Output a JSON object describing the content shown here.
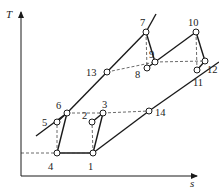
{
  "diagram": {
    "type": "T-s diagram",
    "axes": {
      "x_label": "s",
      "y_label": "T"
    },
    "states": [
      {
        "id": "1",
        "label": "1"
      },
      {
        "id": "2",
        "label": "2"
      },
      {
        "id": "3",
        "label": "3"
      },
      {
        "id": "4",
        "label": "4"
      },
      {
        "id": "5",
        "label": "5"
      },
      {
        "id": "6",
        "label": "6"
      },
      {
        "id": "7",
        "label": "7"
      },
      {
        "id": "8",
        "label": "8"
      },
      {
        "id": "9",
        "label": "9"
      },
      {
        "id": "10",
        "label": "10"
      },
      {
        "id": "11",
        "label": "11"
      },
      {
        "id": "12",
        "label": "12"
      },
      {
        "id": "13",
        "label": "13"
      },
      {
        "id": "14",
        "label": "14"
      }
    ],
    "processes_solid": [
      [
        "4",
        "6"
      ],
      [
        "6",
        "5"
      ],
      [
        "4",
        "1"
      ],
      [
        "1",
        "3"
      ],
      [
        "3",
        "2"
      ],
      [
        "1",
        "14"
      ],
      [
        "6",
        "13"
      ],
      [
        "13",
        "7"
      ],
      [
        "7",
        "9"
      ],
      [
        "9",
        "10"
      ],
      [
        "10",
        "12"
      ],
      [
        "12",
        "11"
      ],
      [
        "9",
        "8"
      ],
      [
        "14",
        "11"
      ]
    ],
    "processes_dashed": [
      [
        "4",
        "5"
      ],
      [
        "1",
        "2"
      ],
      [
        "6",
        "3"
      ],
      [
        "3",
        "14"
      ],
      [
        "7",
        "8"
      ],
      [
        "10",
        "11"
      ],
      [
        "13",
        "9"
      ],
      [
        "9",
        "12"
      ]
    ]
  }
}
